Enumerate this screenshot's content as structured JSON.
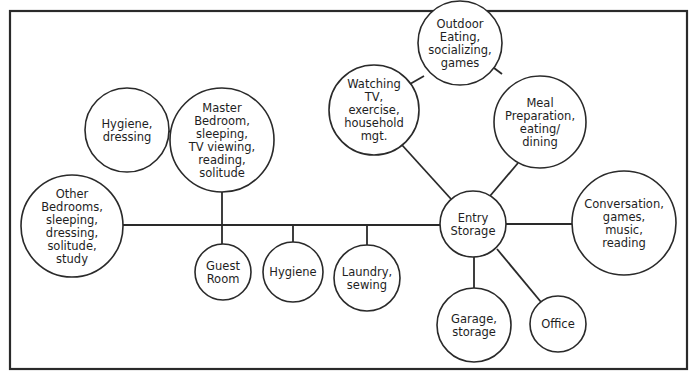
{
  "diagram": {
    "type": "bubble-adjacency-diagram",
    "colors": {
      "stroke": "#2a2a2a",
      "text": "#1e1e1e",
      "background": "#ffffff"
    },
    "frame": {
      "x": 10,
      "y": 11,
      "w": 677,
      "h": 358
    },
    "nodes": [
      {
        "id": "other-bedrooms",
        "cx": 72,
        "cy": 226,
        "r": 51,
        "lines": [
          "Other",
          "Bedrooms,",
          "sleeping,",
          "dressing,",
          "solitude,",
          "study"
        ]
      },
      {
        "id": "hygiene-dressing",
        "cx": 127,
        "cy": 130,
        "r": 42,
        "lines": [
          "Hygiene,",
          "dressing"
        ]
      },
      {
        "id": "master-bedroom",
        "cx": 222,
        "cy": 140,
        "r": 52,
        "lines": [
          "Master",
          "Bedroom,",
          "sleeping,",
          "TV viewing,",
          "reading,",
          "solitude"
        ]
      },
      {
        "id": "guest-room",
        "cx": 223,
        "cy": 272,
        "r": 28,
        "lines": [
          "Guest",
          "Room"
        ]
      },
      {
        "id": "hygiene",
        "cx": 293,
        "cy": 272,
        "r": 30,
        "lines": [
          "Hygiene"
        ]
      },
      {
        "id": "laundry",
        "cx": 367,
        "cy": 278,
        "r": 33,
        "lines": [
          "Laundry,",
          "sewing"
        ]
      },
      {
        "id": "watching-tv",
        "cx": 374,
        "cy": 110,
        "r": 45,
        "lines": [
          "Watching",
          "TV,",
          "exercise,",
          "household",
          "mgt."
        ]
      },
      {
        "id": "outdoor-eating",
        "cx": 460,
        "cy": 43,
        "r": 42,
        "lines": [
          "Outdoor",
          "Eating,",
          "socializing,",
          "games"
        ]
      },
      {
        "id": "meal-preparation",
        "cx": 540,
        "cy": 122,
        "r": 46,
        "lines": [
          "Meal",
          "Preparation,",
          "eating/",
          "dining"
        ]
      },
      {
        "id": "entry-storage",
        "cx": 473,
        "cy": 224,
        "r": 33,
        "lines": [
          "Entry",
          "Storage"
        ]
      },
      {
        "id": "conversation",
        "cx": 624,
        "cy": 223,
        "r": 52,
        "lines": [
          "Conversation,",
          "games,",
          "music,",
          "reading"
        ]
      },
      {
        "id": "garage-storage",
        "cx": 474,
        "cy": 325,
        "r": 37,
        "lines": [
          "Garage,",
          "storage"
        ]
      },
      {
        "id": "office",
        "cx": 558,
        "cy": 324,
        "r": 28,
        "lines": [
          "Office"
        ]
      }
    ],
    "edges": [
      {
        "from": "other-bedrooms",
        "to": "entry-storage",
        "x1": 123,
        "y1": 225,
        "x2": 440,
        "y2": 225,
        "label": "main-corridor"
      },
      {
        "from": "hygiene-dressing",
        "to": "master-bedroom",
        "x1": 169,
        "y1": 131,
        "x2": 170,
        "y2": 132
      },
      {
        "from": "master-bedroom",
        "to": "guest-room",
        "x1": 222,
        "y1": 192,
        "x2": 222,
        "y2": 244
      },
      {
        "from": "corridor",
        "to": "hygiene",
        "x1": 293,
        "y1": 225,
        "x2": 293,
        "y2": 242
      },
      {
        "from": "corridor",
        "to": "laundry",
        "x1": 367,
        "y1": 225,
        "x2": 367,
        "y2": 245
      },
      {
        "from": "watching-tv",
        "to": "entry-storage",
        "x1": 402,
        "y1": 145,
        "x2": 451,
        "y2": 199
      },
      {
        "from": "watching-tv",
        "to": "outdoor-eating",
        "x1": 410,
        "y1": 84,
        "x2": 424,
        "y2": 76
      },
      {
        "from": "outdoor-eating",
        "to": "meal-preparation",
        "x1": 494,
        "y1": 68,
        "x2": 502,
        "y2": 74
      },
      {
        "from": "meal-preparation",
        "to": "entry-storage",
        "x1": 518,
        "y1": 163,
        "x2": 490,
        "y2": 196
      },
      {
        "from": "entry-storage",
        "to": "conversation",
        "x1": 506,
        "y1": 224,
        "x2": 572,
        "y2": 224
      },
      {
        "from": "entry-storage",
        "to": "garage-storage",
        "x1": 474,
        "y1": 257,
        "x2": 474,
        "y2": 288
      },
      {
        "from": "entry-storage",
        "to": "office",
        "x1": 497,
        "y1": 249,
        "x2": 541,
        "y2": 302
      }
    ]
  }
}
